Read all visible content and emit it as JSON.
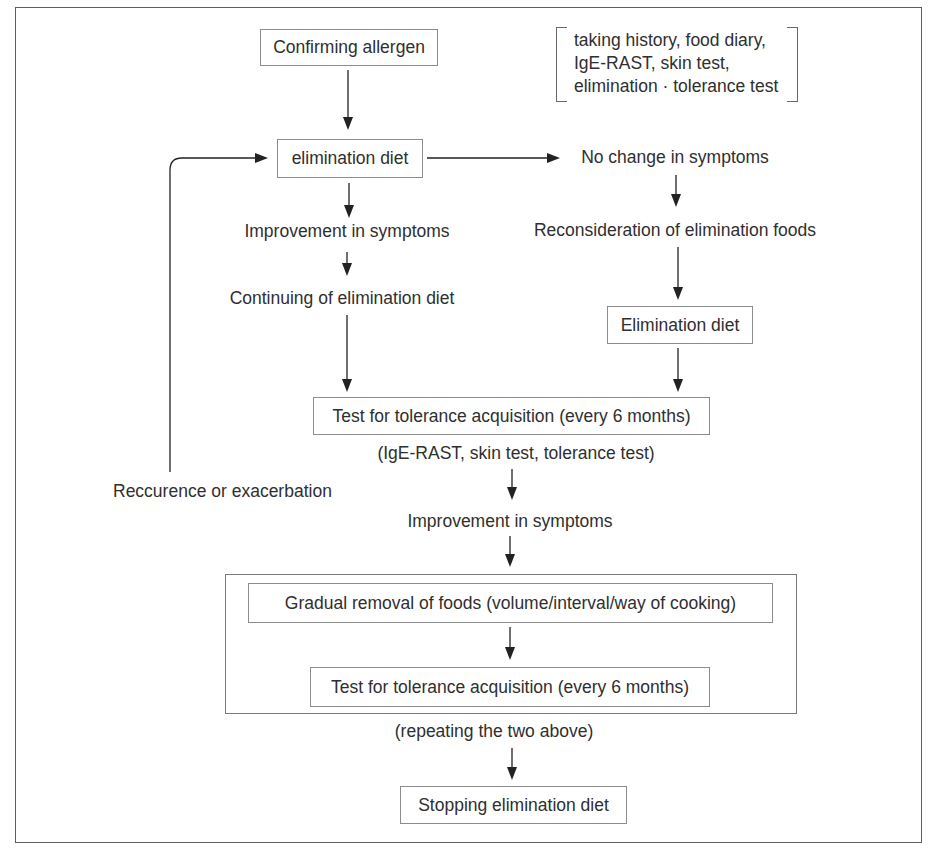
{
  "figure": {
    "boxes": {
      "confirming": "Confirming allergen",
      "elimination_diet": "elimination diet",
      "elimination_diet_2": "Elimination diet",
      "tolerance_test_1": "Test for tolerance acquisition (every 6 months)",
      "gradual_removal": "Gradual removal of foods (volume/interval/way of cooking)",
      "tolerance_test_2": "Test for tolerance acquisition (every 6 months)",
      "stopping": "Stopping elimination diet"
    },
    "labels": {
      "no_change": "No change in symptoms",
      "improvement_1": "Improvement in symptoms",
      "continuing": "Continuing of elimination diet",
      "reconsideration": "Reconsideration of elimination foods",
      "tolerance_caption": "(IgE-RAST, skin test, tolerance test)",
      "recurrence": "Reccurence or exacerbation",
      "improvement_2": "Improvement in symptoms",
      "repeating_caption": "(repeating the two above)"
    },
    "note": {
      "line1": "taking history, food diary,",
      "line2": "IgE-RAST, skin test,",
      "line3": "elimination · tolerance test"
    },
    "colors": {
      "text": "#2f2f2f",
      "box_border": "#8c8c8c",
      "arrow_line": "#222222",
      "frame_border": "#5f5f5f",
      "background": "#ffffff"
    }
  }
}
